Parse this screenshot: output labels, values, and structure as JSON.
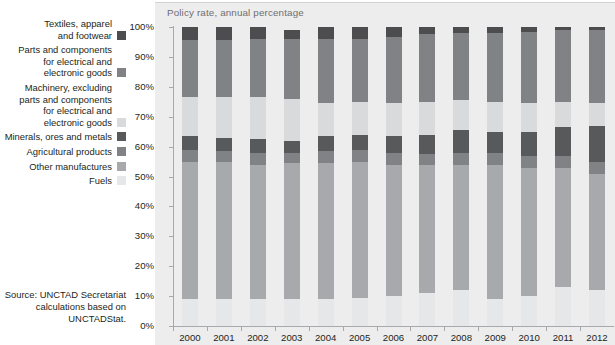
{
  "chart_title": "Policy rate, annual percentage",
  "source_note": "Source:  UNCTAD Secretariat\ncalculations based on\nUNCTADStat.",
  "legend": {
    "items": [
      {
        "label": "Textiles, apparel\nand footwear",
        "color": "#4d4d4f",
        "key": "textiles"
      },
      {
        "label": "Parts and components\nfor electrical and\nelectronic goods",
        "color": "#808285",
        "key": "parts_electrical"
      },
      {
        "label": "Machinery, excluding\nparts and components\nfor electrical and\nelectronic goods",
        "color": "#d9dadb",
        "key": "machinery"
      },
      {
        "label": "Minerals, ores and metals",
        "color": "#58595b",
        "key": "minerals"
      },
      {
        "label": "Agricultural products",
        "color": "#808285",
        "key": "agricultural"
      },
      {
        "label": "Other manufactures",
        "color": "#a7a9ac",
        "key": "other_manufactures"
      },
      {
        "label": "Fuels",
        "color": "#e6e7e8",
        "key": "fuels"
      }
    ]
  },
  "chart_data": {
    "type": "bar",
    "stacked": true,
    "title": "Policy rate, annual percentage",
    "xlabel": "",
    "ylabel": "",
    "ylim": [
      0,
      100
    ],
    "ytick_labels": [
      "0%",
      "10%",
      "20%",
      "30%",
      "40%",
      "50%",
      "60%",
      "70%",
      "80%",
      "90%",
      "100%"
    ],
    "ytick_values": [
      0,
      10,
      20,
      30,
      40,
      50,
      60,
      70,
      80,
      90,
      100
    ],
    "grid": false,
    "legend_position": "left",
    "categories": [
      "2000",
      "2001",
      "2002",
      "2003",
      "2004",
      "2005",
      "2006",
      "2007",
      "2008",
      "2009",
      "2010",
      "2011",
      "2012"
    ],
    "stack_order_bottom_to_top": [
      "Fuels",
      "Other manufactures",
      "Agricultural products",
      "Minerals, ores and metals",
      "Machinery, excluding parts and components for electrical and electronic goods",
      "Parts and components for electrical and electronic goods",
      "Textiles, apparel and footwear"
    ],
    "series": [
      {
        "name": "Fuels",
        "color": "#e6e7e8",
        "values": [
          9,
          9,
          9,
          9,
          9,
          9.5,
          10,
          11,
          12,
          9,
          10,
          13,
          12
        ]
      },
      {
        "name": "Other manufactures",
        "color": "#a7a9ac",
        "values": [
          46,
          46,
          45,
          45.5,
          45.5,
          45.5,
          44,
          43,
          42,
          45,
          43,
          40,
          39
        ]
      },
      {
        "name": "Agricultural products",
        "color": "#808285",
        "values": [
          4,
          3.5,
          4,
          3.5,
          4,
          4,
          4,
          3.5,
          4,
          4,
          4,
          4,
          4
        ]
      },
      {
        "name": "Minerals, ores and metals",
        "color": "#58595b",
        "values": [
          4.5,
          4.5,
          4.5,
          4,
          5,
          5,
          5.5,
          6.5,
          7.5,
          7,
          8,
          9.5,
          12
        ]
      },
      {
        "name": "Machinery, excluding parts and components for electrical and electronic goods",
        "color": "#d9dadb",
        "values": [
          13,
          13.5,
          14,
          14,
          11,
          11,
          11,
          11,
          10,
          10,
          9.5,
          8.5,
          7.5
        ]
      },
      {
        "name": "Parts and components for electrical and electronic goods",
        "color": "#808285",
        "values": [
          19,
          19,
          19.5,
          20,
          21.5,
          21,
          22,
          22.5,
          22.5,
          23,
          24,
          24,
          24.5
        ]
      },
      {
        "name": "Textiles, apparel and footwear",
        "color": "#4d4d4f",
        "values": [
          4.5,
          4.5,
          4,
          3,
          4,
          4,
          3.5,
          2.5,
          2,
          2,
          1.5,
          1,
          1
        ]
      }
    ]
  }
}
